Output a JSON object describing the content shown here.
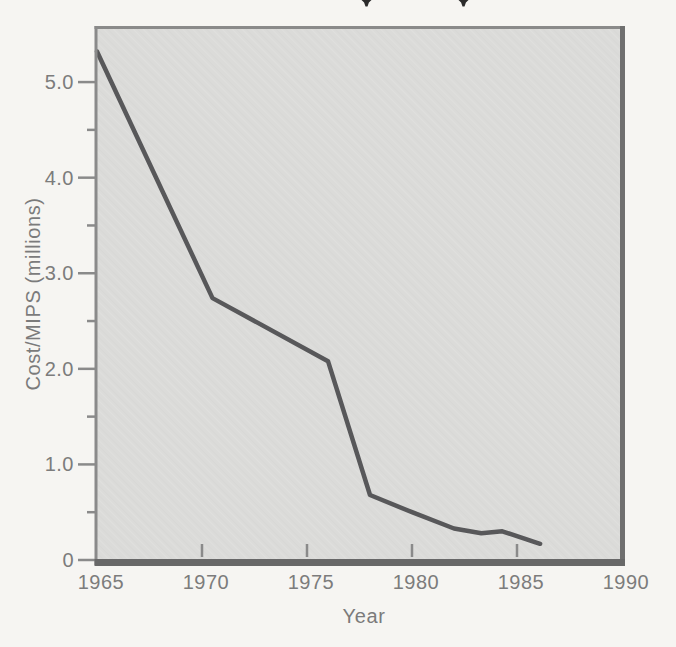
{
  "artifacts": {
    "top_cropped_text_marks": [
      "descender-tip",
      "descender-tip"
    ]
  },
  "chart_data": {
    "type": "line",
    "xlabel": "Year",
    "ylabel": "Cost/MIPS (millions)",
    "xlim": [
      1965,
      1990
    ],
    "ylim": [
      0,
      5.57
    ],
    "x_ticks": [
      1965,
      1970,
      1975,
      1980,
      1985,
      1990
    ],
    "y_ticks_major": [
      0,
      1,
      2,
      3,
      4,
      5
    ],
    "y_tick_labels": [
      "0",
      "1.0",
      "2.0",
      "3.0",
      "4.0",
      "5.0"
    ],
    "y_ticks_minor": [
      0.5,
      1.5,
      2.5,
      3.5,
      4.5
    ],
    "grid": false,
    "legend": "none",
    "series": [
      {
        "name": "cost-per-mips",
        "points": [
          [
            1965,
            5.32
          ],
          [
            1970.5,
            2.74
          ],
          [
            1976,
            2.08
          ],
          [
            1978,
            0.68
          ],
          [
            1980,
            0.5
          ],
          [
            1982,
            0.33
          ],
          [
            1983.3,
            0.28
          ],
          [
            1984.3,
            0.3
          ],
          [
            1986.1,
            0.17
          ]
        ]
      }
    ],
    "colors": {
      "line": "#58585a",
      "plot_background": "#dbdbd9",
      "plot_texture": "#cfcfcd",
      "frame": "#8a8a8a",
      "frame_shadow_bottom": "#686868",
      "frame_shadow_right": "#6f6f6f",
      "tick": "#8a8a8a",
      "text": "#7c7c7c",
      "page_background": "#f6f5f2",
      "crop_mark": "#2b2b2b"
    }
  }
}
